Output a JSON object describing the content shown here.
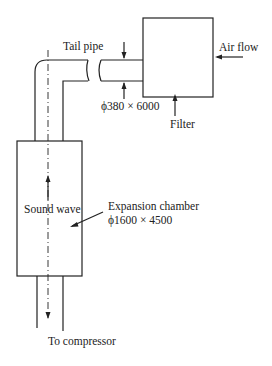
{
  "diagram": {
    "type": "engineering-schematic",
    "labels": {
      "tail_pipe": "Tail pipe",
      "air_flow": "Air flow",
      "pipe_dim": "ϕ380 × 6000",
      "filter": "Filter",
      "sound_wave": "Sound wave",
      "expansion_chamber": "Expansion chamber",
      "chamber_dim": "ϕ1600 × 4500",
      "to_compressor": "To compressor"
    },
    "colors": {
      "stroke": "#222222",
      "background": "#ffffff"
    }
  }
}
